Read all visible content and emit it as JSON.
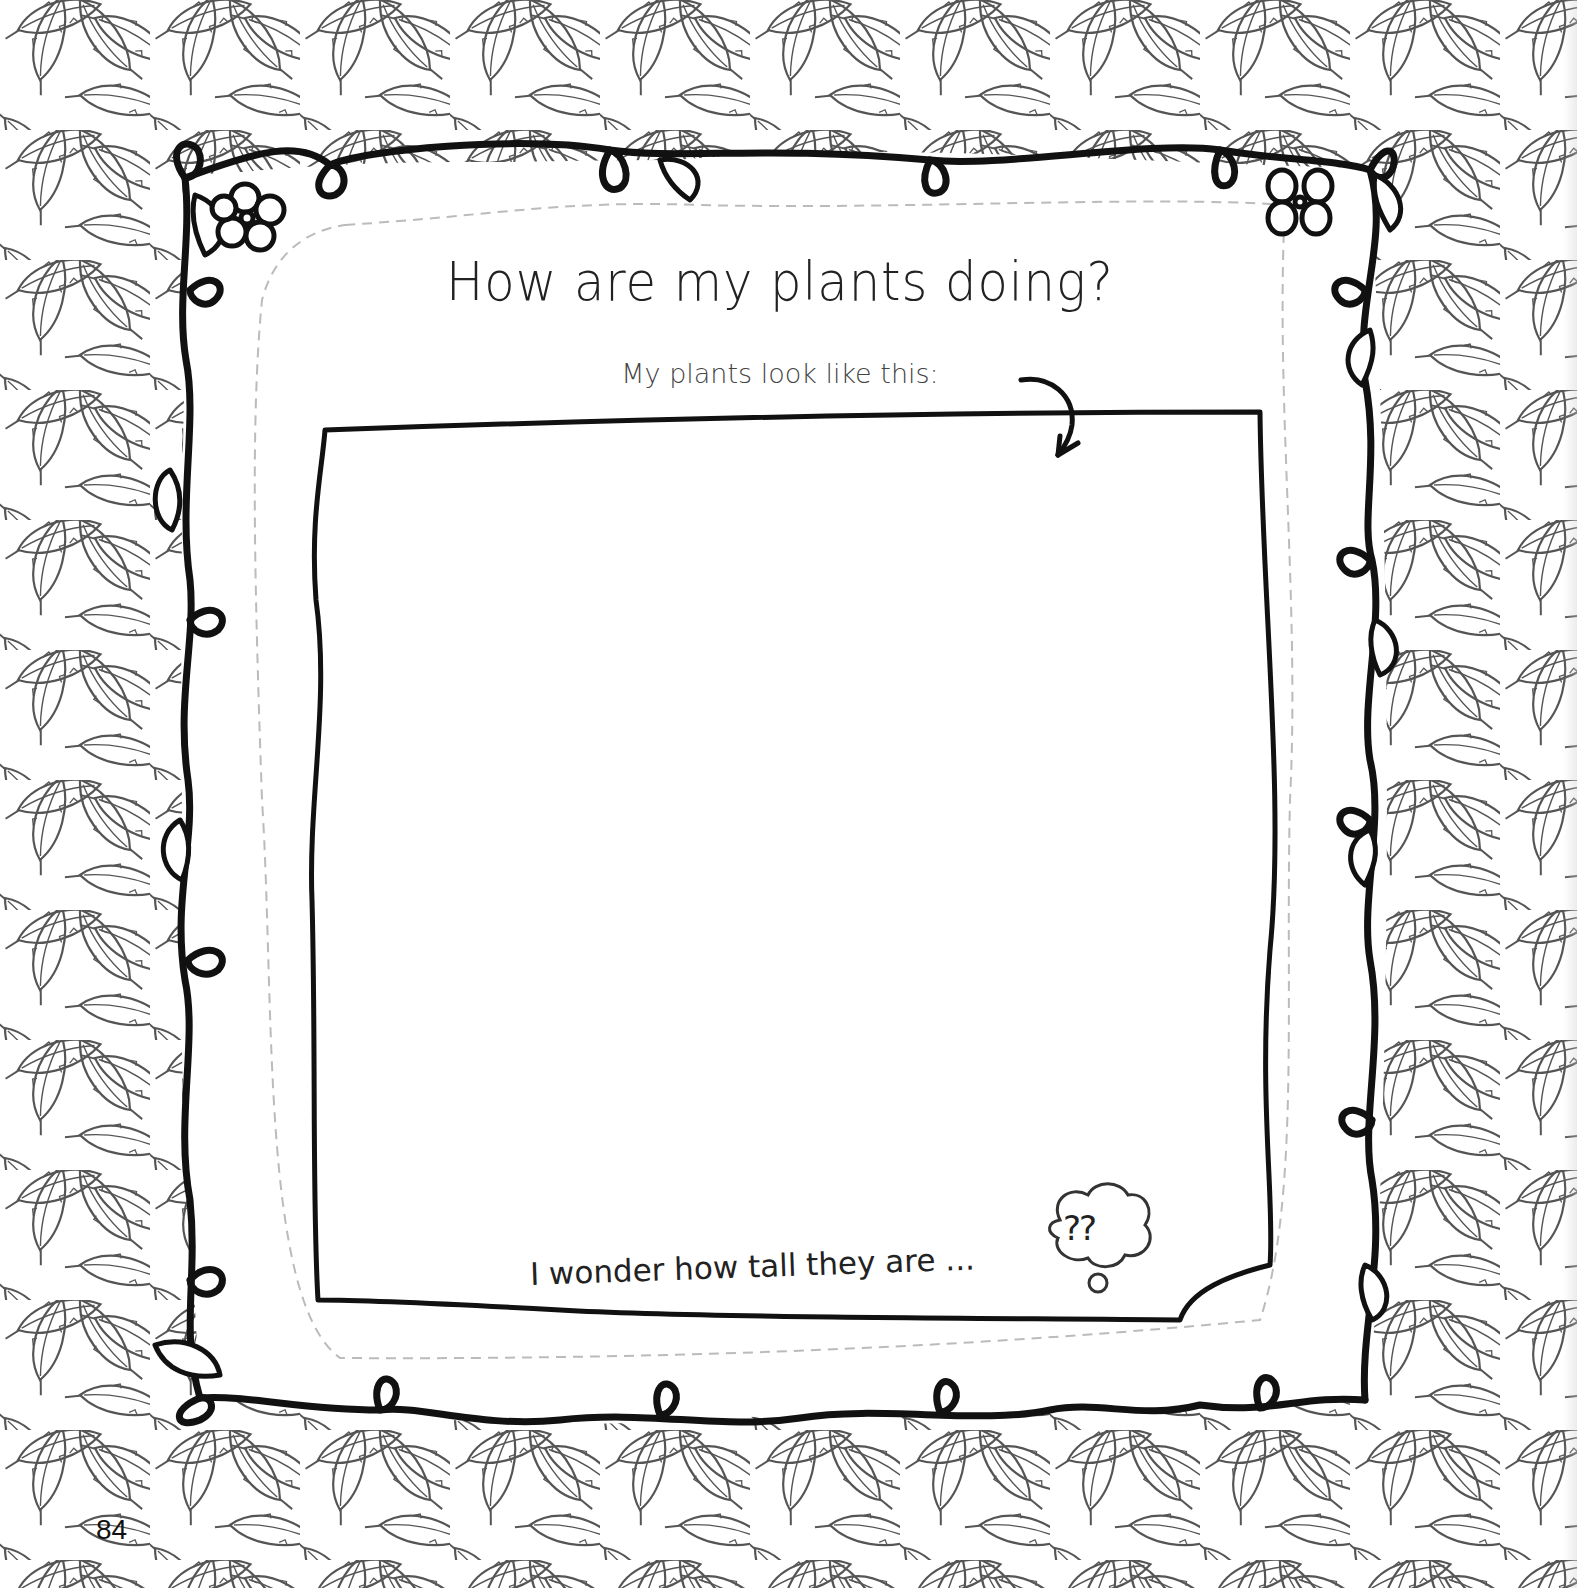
{
  "page": {
    "title": "How are my plants doing?",
    "subtitle": "My plants look like this:",
    "prompt": "I wonder how tall they are ...",
    "thought_bubble_text": "??",
    "page_number": "84"
  },
  "drawing_area": {
    "label": "Drawing area for plants",
    "content": ""
  },
  "decorations": {
    "border": "leaf-pattern-border",
    "frame": "vine-frame-with-loops",
    "flowers": [
      "flower-top-left",
      "flower-top-right"
    ],
    "arrow": "curved-arrow-pointing-to-box",
    "thought_bubble": "thought-cloud"
  },
  "colors": {
    "ink": "#111111",
    "leaf_line": "#555555",
    "dashed_line": "#bbbbbb",
    "paper": "#ffffff"
  }
}
